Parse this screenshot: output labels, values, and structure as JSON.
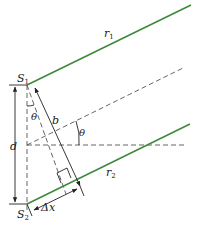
{
  "diagram": {
    "colors": {
      "ray": "#3d8a3a",
      "line": "#222222",
      "dashed": "#555555",
      "background": "#ffffff"
    },
    "labels": {
      "s1": "S",
      "s1_sub": "1",
      "s2": "S",
      "s2_sub": "2",
      "r1": "r",
      "r1_sub": "1",
      "r2": "r",
      "r2_sub": "2",
      "d": "d",
      "b": "b",
      "theta_left": "θ",
      "theta_right": "θ",
      "delta_x": "Δx"
    },
    "points": {
      "S1": [
        27,
        85
      ],
      "S2": [
        27,
        204
      ],
      "midpoint": [
        27,
        145
      ]
    },
    "elements": [
      {
        "name": "ray-r1",
        "type": "solid-green",
        "from": [
          27,
          85
        ],
        "to": [
          191,
          5
        ]
      },
      {
        "name": "ray-r2",
        "type": "solid-green",
        "from": [
          27,
          204
        ],
        "to": [
          190,
          124
        ]
      },
      {
        "name": "center-ray",
        "type": "dashed",
        "from": [
          27,
          145
        ],
        "to": [
          183,
          68
        ]
      },
      {
        "name": "axis-horizontal",
        "type": "dashed",
        "from": [
          27,
          145
        ],
        "to": [
          186,
          145
        ]
      },
      {
        "name": "axis-vertical",
        "type": "dashed",
        "from": [
          27,
          85
        ],
        "to": [
          27,
          210
        ]
      },
      {
        "name": "perpendicular",
        "type": "dashed",
        "from": [
          27,
          85
        ],
        "to": [
          66,
          194
        ]
      },
      {
        "name": "b-dimension",
        "type": "arrow-both",
        "from": [
          34,
          86
        ],
        "to": [
          80,
          186
        ]
      },
      {
        "name": "d-dimension",
        "type": "arrow-both",
        "from": [
          15,
          85
        ],
        "to": [
          15,
          204
        ]
      },
      {
        "name": "delta-x-dimension",
        "type": "arrow-both",
        "from": [
          33,
          212
        ],
        "to": [
          77,
          191
        ]
      }
    ]
  }
}
